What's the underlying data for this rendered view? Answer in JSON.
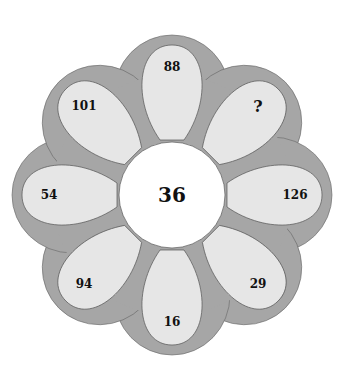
{
  "puzzle": {
    "center": "36",
    "petals": [
      {
        "position": "top",
        "value": "88"
      },
      {
        "position": "top-right",
        "value": "?"
      },
      {
        "position": "right",
        "value": "126"
      },
      {
        "position": "bottom-right",
        "value": "29"
      },
      {
        "position": "bottom",
        "value": "16"
      },
      {
        "position": "bottom-left",
        "value": "94"
      },
      {
        "position": "left",
        "value": "54"
      },
      {
        "position": "top-left",
        "value": "101"
      }
    ]
  },
  "colors": {
    "outer": "#a6a6a6",
    "petal": "#e6e6e6",
    "center": "#ffffff",
    "stroke": "#555555"
  }
}
